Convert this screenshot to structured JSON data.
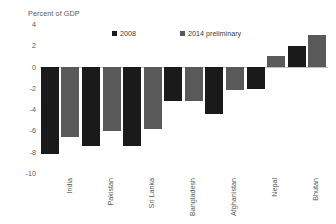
{
  "chart_data": {
    "type": "bar",
    "title": "",
    "subtitle": "",
    "xlabel": "",
    "ylabel": "Percent of GDP",
    "ylim": [
      -10,
      4
    ],
    "yticks": [
      4,
      2,
      0,
      -2,
      -4,
      -6,
      -8,
      -10
    ],
    "ytick_labels": [
      "4",
      "2",
      "0",
      "-2",
      "-4",
      "-6",
      "-8",
      "-10"
    ],
    "grid": false,
    "legend_position": "top-center",
    "categories": [
      "India",
      "Pakistan",
      "Sri Lanka",
      "Bangladesh",
      "Afghanistan",
      "Nepal",
      "Bhutan"
    ],
    "series": [
      {
        "name": "2008",
        "color": "#1a1a1a",
        "values": [
          -8.2,
          -7.5,
          -7.5,
          -3.2,
          -4.5,
          -2.1,
          1.9
        ]
      },
      {
        "name": "2014 preliminary",
        "color": "#595959",
        "values": [
          -6.6,
          -6.1,
          -5.9,
          -3.2,
          -2.2,
          1.0,
          3.0
        ]
      }
    ],
    "annotations": []
  },
  "axis": {
    "title": "Percent of GDP"
  },
  "legend": {
    "items": [
      {
        "label": "2008"
      },
      {
        "label": "2014 preliminary"
      }
    ]
  },
  "colors": {
    "series_2008": "#1a1a1a",
    "series_2014": "#595959",
    "baseline": "#bfbfbf",
    "text": "#595959",
    "background": "#ffffff"
  }
}
